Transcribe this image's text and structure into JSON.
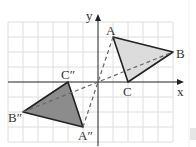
{
  "diagram": {
    "type": "coordinate-plane-rotation",
    "axes": {
      "x_label": "x",
      "y_label": "y"
    },
    "grid": {
      "x_range": [
        -6,
        5
      ],
      "y_range": [
        -4,
        4
      ],
      "unit_px": 15,
      "origin_px": [
        98,
        82
      ]
    },
    "original_triangle": {
      "fill": "#dcdcdc",
      "vertices": [
        {
          "label": "A",
          "x": 1,
          "y": 3
        },
        {
          "label": "B",
          "x": 5,
          "y": 2
        },
        {
          "label": "C",
          "x": 2,
          "y": 0
        }
      ]
    },
    "image_triangle": {
      "fill": "#8c8c8c",
      "vertices": [
        {
          "label": "A″",
          "x": -1,
          "y": -3
        },
        {
          "label": "B″",
          "x": -5,
          "y": -2
        },
        {
          "label": "C″",
          "x": -2,
          "y": 0
        }
      ]
    },
    "labels": {
      "A": "A",
      "B": "B",
      "C": "C",
      "A2": "A″",
      "B2": "B″",
      "C2": "C″",
      "x": "x",
      "y": "y"
    },
    "colors": {
      "axis": "#222222",
      "grid": "#dedede",
      "edge": "#222222",
      "dashed": "#666666"
    }
  }
}
